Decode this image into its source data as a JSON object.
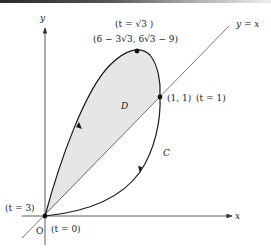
{
  "diagram": {
    "axes": {
      "x_label": "x",
      "y_label": "y",
      "origin_label": "O"
    },
    "line": {
      "label": "y = x"
    },
    "curve": {
      "name": "C",
      "region_name": "D"
    },
    "points": {
      "top": {
        "param": "(t = √3 )",
        "coords": "(6 − 3√3, 6√3 − 9)"
      },
      "intersection": {
        "coords": "(1, 1)",
        "param": "(t = 1)"
      },
      "origin_end": {
        "param": "(t = 3)"
      },
      "origin_start": {
        "param": "(t = 0)"
      }
    },
    "colors": {
      "region_fill": "#e6e6e6",
      "curve": "#1a1a1a",
      "axis": "#333333",
      "line": "#555555"
    }
  }
}
